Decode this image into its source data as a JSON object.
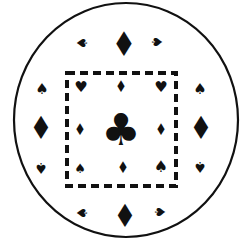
{
  "diagram": {
    "colors": {
      "ink": "#111111",
      "background": "#ffffff"
    },
    "circle": {
      "cx": 126,
      "cy": 120,
      "rx": 112,
      "ry": 117
    },
    "dashed_square": {
      "x": 67,
      "y": 73,
      "width": 109,
      "height": 113
    },
    "symbols": [
      {
        "name": "top-diamond",
        "glyph": "♦",
        "x": 124,
        "y": 44,
        "size": 34,
        "rotate": 0
      },
      {
        "name": "top-left-spade",
        "glyph": "♠",
        "x": 82,
        "y": 43,
        "size": 14,
        "rotate": -90
      },
      {
        "name": "top-right-spade",
        "glyph": "♠",
        "x": 157,
        "y": 42,
        "size": 14,
        "rotate": 90
      },
      {
        "name": "left-upper-spade",
        "glyph": "♠",
        "x": 42,
        "y": 89,
        "size": 15,
        "rotate": 0
      },
      {
        "name": "left-diamond",
        "glyph": "♦",
        "x": 41,
        "y": 128,
        "size": 32,
        "rotate": 0
      },
      {
        "name": "left-lower-spade",
        "glyph": "♠",
        "x": 41,
        "y": 167,
        "size": 15,
        "rotate": 180
      },
      {
        "name": "right-upper-spade",
        "glyph": "♠",
        "x": 200,
        "y": 89,
        "size": 15,
        "rotate": 0
      },
      {
        "name": "right-diamond",
        "glyph": "♦",
        "x": 201,
        "y": 128,
        "size": 32,
        "rotate": 0
      },
      {
        "name": "right-lower-spade",
        "glyph": "♠",
        "x": 200,
        "y": 166,
        "size": 15,
        "rotate": 180
      },
      {
        "name": "bottom-diamond",
        "glyph": "♦",
        "x": 125,
        "y": 216,
        "size": 32,
        "rotate": 0
      },
      {
        "name": "bottom-left-spade",
        "glyph": "♠",
        "x": 82,
        "y": 213,
        "size": 14,
        "rotate": -90
      },
      {
        "name": "bottom-right-spade",
        "glyph": "♠",
        "x": 160,
        "y": 212,
        "size": 14,
        "rotate": 90
      },
      {
        "name": "inner-top-left-heart",
        "glyph": "♥",
        "x": 81,
        "y": 87,
        "size": 15,
        "rotate": 0
      },
      {
        "name": "inner-top-diamond",
        "glyph": "♦",
        "x": 121,
        "y": 87,
        "size": 16,
        "rotate": 0
      },
      {
        "name": "inner-top-right-heart",
        "glyph": "♥",
        "x": 161,
        "y": 87,
        "size": 15,
        "rotate": 0
      },
      {
        "name": "inner-left-diamond",
        "glyph": "♦",
        "x": 80,
        "y": 130,
        "size": 16,
        "rotate": 0
      },
      {
        "name": "center-club",
        "glyph": "♣",
        "x": 121,
        "y": 130,
        "size": 44,
        "rotate": 0
      },
      {
        "name": "inner-right-diamond",
        "glyph": "♦",
        "x": 161,
        "y": 130,
        "size": 16,
        "rotate": 0
      },
      {
        "name": "inner-bottom-left-spade",
        "glyph": "♠",
        "x": 80,
        "y": 168,
        "size": 13,
        "rotate": 0
      },
      {
        "name": "inner-bottom-diamond",
        "glyph": "♦",
        "x": 123,
        "y": 168,
        "size": 16,
        "rotate": 0
      },
      {
        "name": "inner-bottom-right-spade",
        "glyph": "♠",
        "x": 161,
        "y": 167,
        "size": 16,
        "rotate": 0
      }
    ]
  }
}
